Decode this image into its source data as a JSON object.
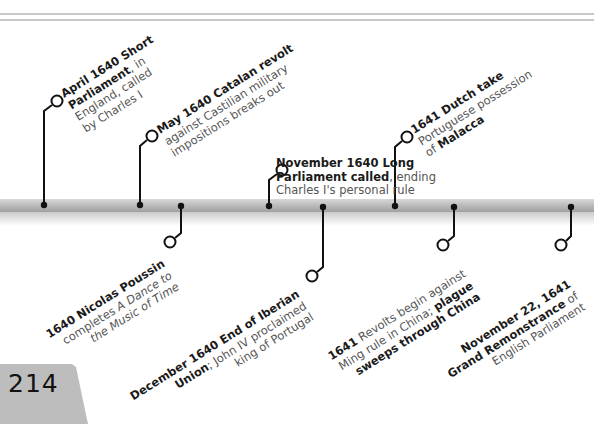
{
  "page": {
    "number": "214"
  },
  "colors": {
    "bar": "#b8b8b8",
    "stem": "#111111",
    "bold_text": "#1a1a1a",
    "body_text": "#555555",
    "page_tab": "#bdbdbd"
  },
  "events_above": [
    {
      "id": "e1",
      "bold": "April 1640 Short Parliament",
      "rest": ", in England, called by Charles I",
      "lines": [
        [
          {
            "b": "April 1640 Short"
          }
        ],
        [
          {
            "b": "Parliament"
          },
          {
            "t": ", in"
          }
        ],
        [
          {
            "t": "England, called"
          }
        ],
        [
          {
            "t": "by Charles I"
          }
        ]
      ]
    },
    {
      "id": "e2",
      "bold": "May 1640 Catalan revolt",
      "rest": " against Castilian military impositions breaks out",
      "lines": [
        [
          {
            "b": "May 1640 Catalan revolt"
          }
        ],
        [
          {
            "t": "against Castilian military"
          }
        ],
        [
          {
            "t": "impositions breaks out"
          }
        ]
      ]
    },
    {
      "id": "e3",
      "bold": "November 1640 Long Parliament called",
      "rest": ", ending Charles I's personal rule",
      "lines": [
        [
          {
            "b": "November 1640 Long"
          }
        ],
        [
          {
            "b": "Parliament called"
          },
          {
            "t": ", ending"
          }
        ],
        [
          {
            "t": "Charles I's personal rule"
          }
        ]
      ]
    },
    {
      "id": "e4",
      "bold": "1641 Dutch take",
      "rest": " Portuguese possession of Malacca",
      "lines": [
        [
          {
            "b": "1641 Dutch take"
          }
        ],
        [
          {
            "t": "Portuguese possession"
          }
        ],
        [
          {
            "t": "of "
          },
          {
            "b": "Malacca"
          }
        ]
      ]
    }
  ],
  "events_below": [
    {
      "id": "e5",
      "bold": "1640 Nicolas Poussin",
      "rest": " completes A Dance to the Music of Time",
      "lines": [
        [
          {
            "b": "1640 Nicolas Poussin"
          }
        ],
        [
          {
            "t": "completes "
          },
          {
            "i": "A Dance to"
          }
        ],
        [
          {
            "i": "the Music of Time"
          }
        ]
      ]
    },
    {
      "id": "e6",
      "bold": "December 1640 End of Iberian Union",
      "rest": "; John IV proclaimed king of Portugal",
      "lines": [
        [
          {
            "b": "December 1640 End of Iberian"
          }
        ],
        [
          {
            "b": "Union"
          },
          {
            "t": "; John IV proclaimed"
          }
        ],
        [
          {
            "t": "king of Portugal"
          }
        ]
      ]
    },
    {
      "id": "e7",
      "bold": "1641",
      "rest": " Revolts begin against Ming rule in China; plague sweeps through China",
      "lines": [
        [
          {
            "b": "1641"
          },
          {
            "t": " Revolts begin against"
          }
        ],
        [
          {
            "t": "Ming rule in China; "
          },
          {
            "b": "plague"
          }
        ],
        [
          {
            "b": "sweeps through China"
          }
        ]
      ]
    },
    {
      "id": "e8",
      "bold": "November 22, 1641 Grand Remonstrance",
      "rest": " of English Parliament",
      "lines": [
        [
          {
            "b": "November 22, 1641"
          }
        ],
        [
          {
            "b": "Grand Remonstrance"
          },
          {
            "t": " of"
          }
        ],
        [
          {
            "t": "English Parliament"
          }
        ]
      ]
    }
  ]
}
